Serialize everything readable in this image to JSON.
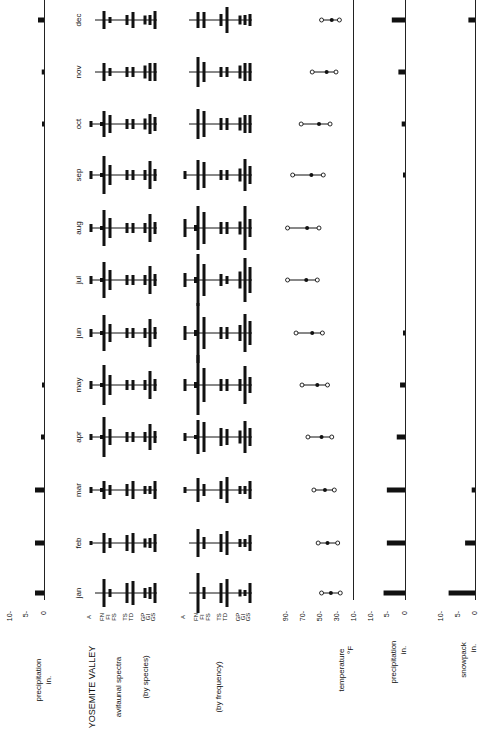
{
  "chart_data": {
    "type": "table",
    "title": "YOSEMITE VALLEY",
    "orientation": "rotated 90deg counter-clockwise (months run bottom-to-top)",
    "months": [
      "jan",
      "feb",
      "mar",
      "apr",
      "may",
      "jun",
      "jul",
      "aug",
      "sep",
      "oct",
      "nov",
      "dec"
    ],
    "panels": [
      {
        "name": "precipitation-left",
        "type": "bar",
        "label": "precipitation",
        "unit": "in.",
        "ticks": [
          "10-",
          "5-",
          "0"
        ],
        "values": [
          6,
          6,
          6,
          2,
          1,
          0,
          0,
          0,
          0,
          0.3,
          1.5,
          4
        ]
      },
      {
        "name": "avifaunal-spectra-by-species",
        "type": "spectrum",
        "label_lines": [
          "avifaunal spectra",
          "(by species)"
        ],
        "categories": [
          "A",
          "FN",
          "FI",
          "FS",
          "TS",
          "TD",
          "GP",
          "GI",
          "GS"
        ]
      },
      {
        "name": "avifaunal-spectra-by-frequency",
        "type": "spectrum",
        "label_lines": [
          "(by frequency)"
        ],
        "categories": [
          "A",
          "FN",
          "FI",
          "FS",
          "TS",
          "TD",
          "GP",
          "GI",
          "GS"
        ]
      },
      {
        "name": "temperature",
        "type": "range",
        "label": "temperature",
        "unit": "°F",
        "ticks": [
          "90-",
          "70-",
          "50-",
          "30-",
          "10-"
        ],
        "ylim": [
          10,
          90
        ],
        "series": [
          {
            "name": "min",
            "values": [
              25,
              28,
              32,
              35,
              40,
              46,
              52,
              50,
              45,
              37,
              30,
              26
            ]
          },
          {
            "name": "mean",
            "values": [
              36,
              40,
              43,
              47,
              52,
              58,
              65,
              64,
              59,
              50,
              41,
              35
            ]
          },
          {
            "name": "max",
            "values": [
              47,
              51,
              56,
              63,
              70,
              77,
              87,
              87,
              81,
              71,
              58,
              47
            ]
          }
        ]
      },
      {
        "name": "precipitation-right",
        "type": "bar",
        "label": "precipitation",
        "unit": "in.",
        "ticks": [
          "10-",
          "5-",
          "0"
        ],
        "values": [
          6.5,
          5.5,
          5.5,
          2.5,
          1.5,
          0.5,
          0,
          0,
          0.3,
          1,
          2,
          4
        ]
      },
      {
        "name": "snowpack",
        "type": "bar",
        "label": "snowpack",
        "unit": "in.",
        "ticks": [
          "10-",
          "5-",
          "0"
        ],
        "values": [
          8,
          3,
          1,
          0,
          0,
          0,
          0,
          0,
          0,
          0,
          0,
          2
        ]
      }
    ]
  },
  "labels": {
    "title": "YOSEMITE VALLEY",
    "spectra_line1": "avifaunal spectra",
    "spectra_line2": "(by species)",
    "frequency": "(by frequency)",
    "precip_left": "precipitation",
    "precip_left_unit": "in.",
    "temperature": "temperature",
    "temperature_unit": "°F",
    "precip_right": "precipitation",
    "precip_right_unit": "in.",
    "snowpack": "snowpack",
    "snowpack_unit": "in.",
    "tick_10": "10-",
    "tick_5": "5-",
    "tick_0": "0",
    "t90": "90-",
    "t70": "70-",
    "t50": "50-",
    "t30": "30-",
    "t10": "10-",
    "cat_A": "A",
    "cat_FN": "FN",
    "cat_FI": "FI",
    "cat_FS": "FS",
    "cat_TS": "TS",
    "cat_TD": "TD",
    "cat_GP": "GP",
    "cat_GI": "GI",
    "cat_GS": "GS"
  }
}
